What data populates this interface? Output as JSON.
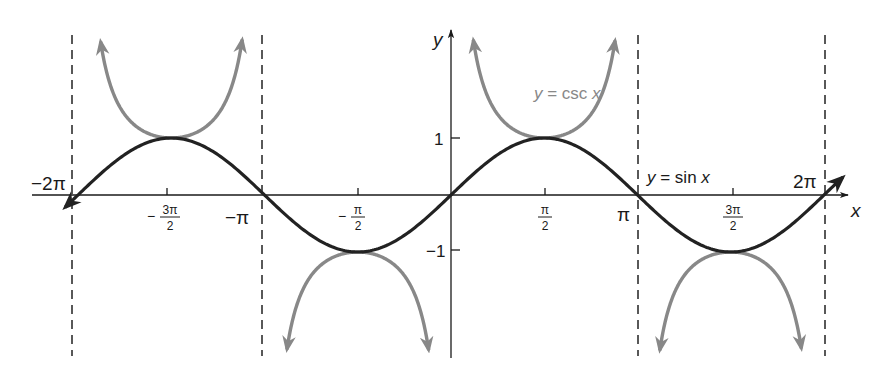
{
  "chart_data": {
    "type": "line",
    "title": "",
    "xlabel": "x",
    "ylabel": "y",
    "xlim": [
      -6.5,
      6.6
    ],
    "ylim": [
      -2.9,
      2.8
    ],
    "grid": false,
    "x_ticks": [
      {
        "value": -6.2832,
        "label": "−2π"
      },
      {
        "value": -4.7124,
        "label_num": "3π",
        "label_den": "2",
        "sign": "−"
      },
      {
        "value": -3.1416,
        "label": "−π"
      },
      {
        "value": -1.5708,
        "label_num": "π",
        "label_den": "2",
        "sign": "−"
      },
      {
        "value": 1.5708,
        "label_num": "π",
        "label_den": "2",
        "sign": ""
      },
      {
        "value": 3.1416,
        "label": "π"
      },
      {
        "value": 4.7124,
        "label_num": "3π",
        "label_den": "2",
        "sign": ""
      },
      {
        "value": 6.2832,
        "label": "2π"
      }
    ],
    "y_ticks": [
      {
        "value": 1,
        "label": "1"
      },
      {
        "value": -1,
        "label": "−1"
      }
    ],
    "asymptotes_x": [
      -6.2832,
      -3.1416,
      3.1416,
      6.2832
    ],
    "series": [
      {
        "name": "y = sin x",
        "function": "sin",
        "domain": [
          -6.5,
          6.6
        ],
        "color": "#222222"
      },
      {
        "name": "y = csc x",
        "function": "csc",
        "color": "#888888",
        "branches": [
          [
            -6.6,
            -6.35
          ],
          [
            -6.2,
            -3.23
          ],
          [
            -3.05,
            -0.09
          ],
          [
            0.09,
            3.05
          ],
          [
            3.23,
            6.2
          ],
          [
            6.37,
            6.6
          ]
        ]
      }
    ],
    "annotations": [
      {
        "text": "y = sin x",
        "near": [
          3.3,
          0.3
        ]
      },
      {
        "text": "y = csc x",
        "near": [
          1.5,
          2.0
        ]
      }
    ],
    "key_points": {
      "sin_max": [
        [
          -4.7124,
          1
        ],
        [
          1.5708,
          1
        ]
      ],
      "sin_min": [
        [
          -1.5708,
          -1
        ],
        [
          4.7124,
          -1
        ]
      ],
      "csc_local_min": [
        [
          -4.7124,
          1
        ],
        [
          1.5708,
          1
        ]
      ],
      "csc_local_max": [
        [
          -1.5708,
          -1
        ],
        [
          4.7124,
          -1
        ]
      ]
    },
    "legend": "none (inline labels)"
  },
  "labels": {
    "x_axis": "x",
    "y_axis": "y",
    "sin_label_y": "y",
    "sin_label_rest": " = sin ",
    "sin_label_x": "x",
    "csc_label_y": "y",
    "csc_label_rest": " = csc ",
    "csc_label_x": "x",
    "tick_neg2pi": "−2π",
    "tick_negpi": "−π",
    "tick_pi": "π",
    "tick_2pi": "2π",
    "tick_neg3pi2_sign": "−",
    "tick_neg3pi2_num": "3π",
    "tick_neg3pi2_den": "2",
    "tick_negpi2_sign": "−",
    "tick_negpi2_num": "π",
    "tick_negpi2_den": "2",
    "tick_pi2_num": "π",
    "tick_pi2_den": "2",
    "tick_3pi2_num": "3π",
    "tick_3pi2_den": "2",
    "tick_y1": "1",
    "tick_yneg1": "−1"
  },
  "colors": {
    "sin": "#222222",
    "csc": "#888888",
    "axis": "#1a1a1a",
    "asymptote": "#222222"
  }
}
